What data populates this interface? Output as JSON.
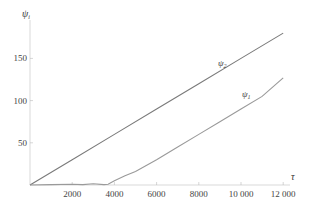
{
  "chart_data": {
    "type": "line",
    "title": "",
    "xlabel": "τ",
    "ylabel": "ψ_i",
    "xlim": [
      0,
      12500
    ],
    "ylim": [
      0,
      190
    ],
    "x_ticks": [
      2000,
      4000,
      6000,
      8000,
      10000,
      12000
    ],
    "x_tick_labels": [
      "2000",
      "4000",
      "6000",
      "8000",
      "10 000",
      "12 000"
    ],
    "y_ticks": [
      50,
      100,
      150
    ],
    "y_tick_labels": [
      "50",
      "100",
      "150"
    ],
    "grid": false,
    "legend": "inline labels on lines",
    "series": [
      {
        "name": "ψ_2",
        "label_main": "ψ",
        "label_sub": "2",
        "color": "#7a7a7a",
        "x": [
          0,
          2000,
          4000,
          6000,
          8000,
          10000,
          12000
        ],
        "y": [
          0,
          30,
          60,
          90,
          120,
          150,
          180
        ]
      },
      {
        "name": "ψ_1",
        "label_main": "ψ",
        "label_sub": "1",
        "color": "#9a9a9a",
        "x": [
          0,
          1000,
          2000,
          2500,
          3000,
          3500,
          3700,
          4000,
          4500,
          5000,
          6000,
          7000,
          8000,
          9000,
          10000,
          11000,
          12000
        ],
        "y": [
          0,
          0.5,
          1,
          0.5,
          1.5,
          0.5,
          1,
          5,
          11,
          16,
          30,
          45,
          60,
          75,
          90,
          105,
          127
        ]
      }
    ]
  }
}
